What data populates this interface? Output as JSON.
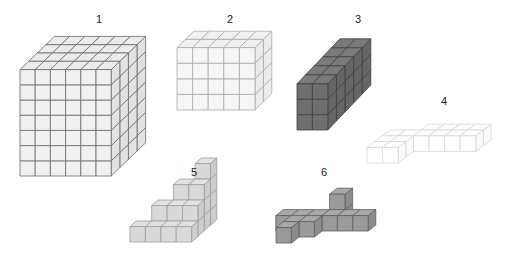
{
  "figure": {
    "shapes": [
      {
        "id": "1",
        "label": "1",
        "label_pos": [
          99,
          14
        ],
        "fill": "#f1f1f1",
        "top": "#ececec",
        "side": "#e2e2e2",
        "stroke": "#6a6a6a",
        "origin": [
          20,
          176
        ],
        "unit": 15.2,
        "depth": [
          8.6,
          -8.3
        ],
        "box": [
          6,
          7,
          4
        ]
      },
      {
        "id": "2",
        "label": "2",
        "label_pos": [
          230,
          14
        ],
        "fill": "#f6f6f6",
        "top": "#f0f0f0",
        "side": "#ebebeb",
        "stroke": "#a9a9a9",
        "origin": [
          177,
          110
        ],
        "unit": 15.6,
        "depth": [
          8.4,
          -8.2
        ],
        "box": [
          5,
          4,
          2
        ]
      },
      {
        "id": "3",
        "label": "3",
        "label_pos": [
          358,
          14
        ],
        "fill": "#6f6f6f",
        "top": "#7a7a7a",
        "side": "#666666",
        "stroke": "#3e3e3e",
        "origin": [
          297,
          130
        ],
        "unit": 15.4,
        "depth": [
          8.6,
          -9.0
        ],
        "box": [
          2,
          3,
          5
        ]
      },
      {
        "id": "4",
        "label": "4",
        "label_pos": [
          444,
          96
        ],
        "fill": "#ffffff",
        "top": "#ffffff",
        "side": "#fbfbfb",
        "stroke": "#d6d6d6",
        "origin": [
          367,
          163
        ],
        "unit": 15.6,
        "depth": [
          7.6,
          -5.8
        ],
        "cubes": [
          [
            0,
            0,
            0
          ],
          [
            1,
            0,
            0
          ],
          [
            0,
            0,
            1
          ],
          [
            1,
            0,
            1
          ],
          [
            0,
            0,
            2
          ],
          [
            1,
            0,
            2
          ],
          [
            2,
            0,
            2
          ],
          [
            3,
            0,
            2
          ],
          [
            4,
            0,
            2
          ],
          [
            5,
            0,
            2
          ],
          [
            2,
            0,
            3
          ],
          [
            3,
            0,
            3
          ],
          [
            4,
            0,
            3
          ],
          [
            5,
            0,
            3
          ]
        ]
      },
      {
        "id": "5",
        "label": "5",
        "label_pos": [
          194,
          167
        ],
        "fill": "#d9d9d9",
        "top": "#e2e2e2",
        "side": "#cdcdcd",
        "stroke": "#9c9c9c",
        "origin": [
          130,
          242
        ],
        "unit": 15.4,
        "depth": [
          6.3,
          -5.6
        ],
        "cubes": [
          [
            0,
            0,
            0
          ],
          [
            1,
            0,
            0
          ],
          [
            2,
            0,
            0
          ],
          [
            3,
            0,
            0
          ],
          [
            1,
            0,
            1
          ],
          [
            2,
            0,
            1
          ],
          [
            3,
            0,
            1
          ],
          [
            2,
            0,
            2
          ],
          [
            3,
            0,
            2
          ],
          [
            3,
            0,
            3
          ],
          [
            1,
            1,
            1
          ],
          [
            2,
            1,
            1
          ],
          [
            3,
            1,
            1
          ],
          [
            2,
            1,
            2
          ],
          [
            3,
            1,
            2
          ],
          [
            2,
            2,
            2
          ],
          [
            3,
            2,
            2
          ],
          [
            3,
            1,
            3
          ],
          [
            3,
            2,
            3
          ],
          [
            3,
            3,
            3
          ]
        ]
      },
      {
        "id": "6",
        "label": "6",
        "label_pos": [
          324,
          167
        ],
        "fill": "#9a9a9a",
        "top": "#a8a8a8",
        "side": "#8c8c8c",
        "stroke": "#5e5e5e",
        "origin": [
          276,
          243
        ],
        "unit": 15.4,
        "depth": [
          7.6,
          -6.0
        ],
        "cubes": [
          [
            0,
            0,
            0
          ],
          [
            0,
            0,
            1
          ],
          [
            1,
            0,
            1
          ],
          [
            1,
            0,
            2
          ],
          [
            2,
            0,
            2
          ],
          [
            2,
            0,
            3
          ],
          [
            -1,
            0,
            2
          ],
          [
            0,
            0,
            2
          ],
          [
            3,
            0,
            2
          ],
          [
            4,
            0,
            2
          ],
          [
            2,
            1,
            3
          ]
        ]
      }
    ]
  }
}
